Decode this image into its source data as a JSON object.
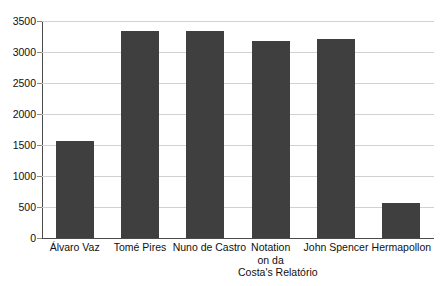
{
  "chart_data": {
    "type": "bar",
    "title": "",
    "subtitle": "",
    "xlabel": "",
    "ylabel": "",
    "categories": [
      "Álvaro Vaz",
      "Tomé Pires",
      "Nuno de Castro",
      "Notation on da Costa's Relatório",
      "John Spencer",
      "Hermapollon"
    ],
    "category_lines": [
      [
        "Álvaro Vaz"
      ],
      [
        "Tomé Pires"
      ],
      [
        "Nuno de Castro"
      ],
      [
        "Notation",
        "on da",
        "Costa's Relatório"
      ],
      [
        "John Spencer"
      ],
      [
        "Hermapollon"
      ]
    ],
    "values": [
      1570,
      3340,
      3340,
      3170,
      3210,
      565
    ],
    "ylim": [
      0,
      3500
    ],
    "ytick_values": [
      0,
      500,
      1000,
      1500,
      2000,
      2500,
      3000,
      3500
    ],
    "ytick_labels": [
      "0",
      "500",
      "1000",
      "1500",
      "2000",
      "2500",
      "3000",
      "3500"
    ],
    "grid": true,
    "legend": false,
    "legend_position": "none",
    "bar_color": "#3f3f3f",
    "grid_color": "#d2d2d2",
    "axis_color": "#4a4a4a",
    "background_color": "#ffffff"
  }
}
